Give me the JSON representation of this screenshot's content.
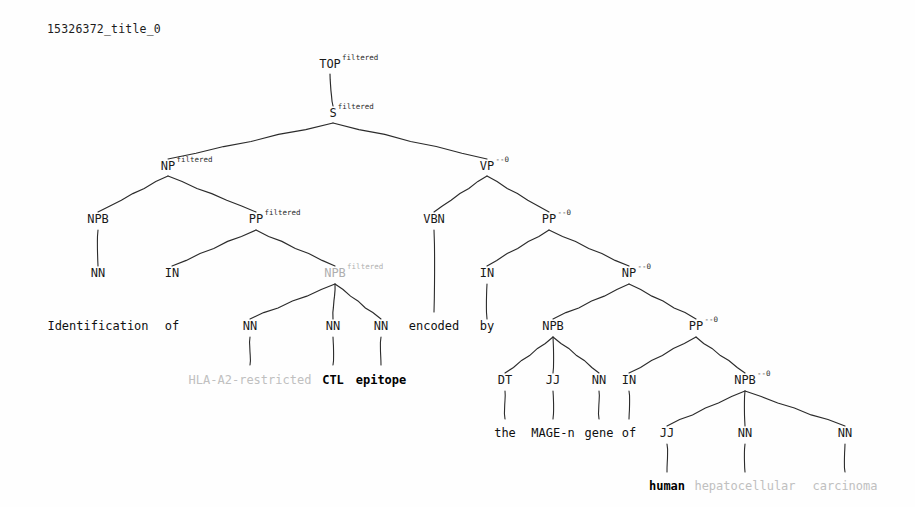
{
  "document": {
    "title": "15326372_title_0",
    "background_color": "#fefefe",
    "ink_color": "#1a1a1a",
    "filtered_color": "#b0b0b0"
  },
  "chart_data": {
    "type": "tree",
    "title": "15326372_title_0",
    "sentence": "Identification of HLA-A2-restricted CTL epitope encoded by the MAGE-n gene of human hepatocellular carcinoma",
    "annotation_legend": {
      "filtered": "filtered",
      "head": "--0"
    },
    "nodes": [
      {
        "id": "top",
        "label": "TOP",
        "sup": "filtered",
        "x": 330,
        "y": 68,
        "gray": false
      },
      {
        "id": "s",
        "label": "S",
        "sup": "filtered",
        "x": 333,
        "y": 117,
        "gray": false
      },
      {
        "id": "np1",
        "label": "NP",
        "sup": "filtered",
        "x": 168,
        "y": 170,
        "gray": false
      },
      {
        "id": "vp",
        "label": "VP",
        "sup": "--0",
        "x": 487,
        "y": 170,
        "gray": false
      },
      {
        "id": "npb1",
        "label": "NPB",
        "sup": "",
        "x": 98,
        "y": 223,
        "gray": false
      },
      {
        "id": "pp1",
        "label": "PP",
        "sup": "filtered",
        "x": 256,
        "y": 223,
        "gray": false
      },
      {
        "id": "vbn",
        "label": "VBN",
        "sup": "",
        "x": 434,
        "y": 223,
        "gray": false
      },
      {
        "id": "pp2",
        "label": "PP",
        "sup": "--0",
        "x": 549,
        "y": 223,
        "gray": false
      },
      {
        "id": "nn1",
        "label": "NN",
        "sup": "",
        "x": 98,
        "y": 277,
        "gray": false
      },
      {
        "id": "in1",
        "label": "IN",
        "sup": "",
        "x": 172,
        "y": 277,
        "gray": false
      },
      {
        "id": "npb2",
        "label": "NPB",
        "sup": "filtered",
        "x": 335,
        "y": 277,
        "gray": true
      },
      {
        "id": "in2",
        "label": "IN",
        "sup": "",
        "x": 487,
        "y": 277,
        "gray": false
      },
      {
        "id": "np2",
        "label": "NP",
        "sup": "--0",
        "x": 629,
        "y": 277,
        "gray": false
      },
      {
        "id": "nn2",
        "label": "NN",
        "sup": "",
        "x": 250,
        "y": 330,
        "gray": false
      },
      {
        "id": "nn3",
        "label": "NN",
        "sup": "",
        "x": 333,
        "y": 330,
        "gray": false
      },
      {
        "id": "nn4",
        "label": "NN",
        "sup": "",
        "x": 381,
        "y": 330,
        "gray": false
      },
      {
        "id": "npb3",
        "label": "NPB",
        "sup": "",
        "x": 553,
        "y": 330,
        "gray": false
      },
      {
        "id": "pp3",
        "label": "PP",
        "sup": "--0",
        "x": 696,
        "y": 330,
        "gray": false
      },
      {
        "id": "dt",
        "label": "DT",
        "sup": "",
        "x": 505,
        "y": 384,
        "gray": false
      },
      {
        "id": "jj1",
        "label": "JJ",
        "sup": "",
        "x": 553,
        "y": 384,
        "gray": false
      },
      {
        "id": "nn5",
        "label": "NN",
        "sup": "",
        "x": 599,
        "y": 384,
        "gray": false
      },
      {
        "id": "in3",
        "label": "IN",
        "sup": "",
        "x": 629,
        "y": 384,
        "gray": false
      },
      {
        "id": "npb4",
        "label": "NPB",
        "sup": "--0",
        "x": 745,
        "y": 384,
        "gray": false
      },
      {
        "id": "jj2",
        "label": "JJ",
        "sup": "",
        "x": 667,
        "y": 437,
        "gray": false
      },
      {
        "id": "nn6",
        "label": "NN",
        "sup": "",
        "x": 745,
        "y": 437,
        "gray": false
      },
      {
        "id": "nn7",
        "label": "NN",
        "sup": "",
        "x": 845,
        "y": 437,
        "gray": false
      }
    ],
    "edges": [
      {
        "from": "top",
        "to": "s",
        "x1": 330,
        "y1": 74,
        "x2": 333,
        "y2": 106
      },
      {
        "from": "s",
        "to": "np1",
        "x1": 333,
        "y1": 123,
        "x2": 168,
        "y2": 159
      },
      {
        "from": "s",
        "to": "vp",
        "x1": 333,
        "y1": 123,
        "x2": 487,
        "y2": 159
      },
      {
        "from": "np1",
        "to": "npb1",
        "x1": 168,
        "y1": 176,
        "x2": 98,
        "y2": 212
      },
      {
        "from": "np1",
        "to": "pp1",
        "x1": 168,
        "y1": 176,
        "x2": 256,
        "y2": 212
      },
      {
        "from": "vp",
        "to": "vbn",
        "x1": 487,
        "y1": 176,
        "x2": 434,
        "y2": 212
      },
      {
        "from": "vp",
        "to": "pp2",
        "x1": 487,
        "y1": 176,
        "x2": 549,
        "y2": 212
      },
      {
        "from": "npb1",
        "to": "nn1",
        "x1": 98,
        "y1": 230,
        "x2": 98,
        "y2": 266
      },
      {
        "from": "pp1",
        "to": "in1",
        "x1": 256,
        "y1": 230,
        "x2": 172,
        "y2": 266
      },
      {
        "from": "pp1",
        "to": "npb2",
        "x1": 256,
        "y1": 230,
        "x2": 335,
        "y2": 266
      },
      {
        "from": "vbn",
        "to": "enc",
        "x1": 434,
        "y1": 230,
        "x2": 434,
        "y2": 312
      },
      {
        "from": "pp2",
        "to": "in2",
        "x1": 549,
        "y1": 230,
        "x2": 487,
        "y2": 266
      },
      {
        "from": "pp2",
        "to": "np2",
        "x1": 549,
        "y1": 230,
        "x2": 629,
        "y2": 266
      },
      {
        "from": "npb2",
        "to": "nn2",
        "x1": 335,
        "y1": 284,
        "x2": 250,
        "y2": 319
      },
      {
        "from": "npb2",
        "to": "nn3",
        "x1": 335,
        "y1": 284,
        "x2": 333,
        "y2": 319
      },
      {
        "from": "npb2",
        "to": "nn4",
        "x1": 335,
        "y1": 284,
        "x2": 381,
        "y2": 319
      },
      {
        "from": "in2",
        "to": "by",
        "x1": 487,
        "y1": 284,
        "x2": 487,
        "y2": 319
      },
      {
        "from": "np2",
        "to": "npb3",
        "x1": 629,
        "y1": 284,
        "x2": 553,
        "y2": 319
      },
      {
        "from": "np2",
        "to": "pp3",
        "x1": 629,
        "y1": 284,
        "x2": 696,
        "y2": 319
      },
      {
        "from": "nn2",
        "to": "hla",
        "x1": 250,
        "y1": 337,
        "x2": 250,
        "y2": 365
      },
      {
        "from": "nn3",
        "to": "ctl",
        "x1": 333,
        "y1": 337,
        "x2": 333,
        "y2": 365
      },
      {
        "from": "nn4",
        "to": "epi",
        "x1": 381,
        "y1": 337,
        "x2": 381,
        "y2": 365
      },
      {
        "from": "npb3",
        "to": "dt",
        "x1": 553,
        "y1": 337,
        "x2": 505,
        "y2": 373
      },
      {
        "from": "npb3",
        "to": "jj1",
        "x1": 553,
        "y1": 337,
        "x2": 553,
        "y2": 373
      },
      {
        "from": "npb3",
        "to": "nn5",
        "x1": 553,
        "y1": 337,
        "x2": 599,
        "y2": 373
      },
      {
        "from": "pp3",
        "to": "in3",
        "x1": 696,
        "y1": 337,
        "x2": 629,
        "y2": 373
      },
      {
        "from": "pp3",
        "to": "npb4",
        "x1": 696,
        "y1": 337,
        "x2": 745,
        "y2": 373
      },
      {
        "from": "dt",
        "to": "the",
        "x1": 505,
        "y1": 391,
        "x2": 505,
        "y2": 419
      },
      {
        "from": "jj1",
        "to": "mage",
        "x1": 553,
        "y1": 391,
        "x2": 553,
        "y2": 419
      },
      {
        "from": "nn5",
        "to": "gene",
        "x1": 599,
        "y1": 391,
        "x2": 599,
        "y2": 419
      },
      {
        "from": "in3",
        "to": "of2",
        "x1": 629,
        "y1": 391,
        "x2": 629,
        "y2": 419
      },
      {
        "from": "npb4",
        "to": "jj2",
        "x1": 745,
        "y1": 391,
        "x2": 667,
        "y2": 426
      },
      {
        "from": "npb4",
        "to": "nn6",
        "x1": 745,
        "y1": 391,
        "x2": 745,
        "y2": 426
      },
      {
        "from": "npb4",
        "to": "nn7",
        "x1": 745,
        "y1": 391,
        "x2": 845,
        "y2": 426
      },
      {
        "from": "jj2",
        "to": "human",
        "x1": 667,
        "y1": 444,
        "x2": 667,
        "y2": 472
      },
      {
        "from": "nn6",
        "to": "hepa",
        "x1": 745,
        "y1": 444,
        "x2": 745,
        "y2": 472
      },
      {
        "from": "nn7",
        "to": "carc",
        "x1": 845,
        "y1": 444,
        "x2": 845,
        "y2": 472
      }
    ],
    "leaves": [
      {
        "id": "ident",
        "text": "Identification",
        "x": 98,
        "y": 330,
        "style": "plain"
      },
      {
        "id": "of1",
        "text": "of",
        "x": 172,
        "y": 330,
        "style": "plain"
      },
      {
        "id": "enc",
        "text": "encoded",
        "x": 434,
        "y": 330,
        "style": "plain"
      },
      {
        "id": "by",
        "text": "by",
        "x": 487,
        "y": 330,
        "style": "plain"
      },
      {
        "id": "hla",
        "text": "HLA-A2-restricted",
        "x": 250,
        "y": 384,
        "style": "gray"
      },
      {
        "id": "ctl",
        "text": "CTL",
        "x": 333,
        "y": 384,
        "style": "bold"
      },
      {
        "id": "epi",
        "text": "epitope",
        "x": 381,
        "y": 384,
        "style": "bold"
      },
      {
        "id": "the",
        "text": "the",
        "x": 505,
        "y": 437,
        "style": "plain"
      },
      {
        "id": "mage",
        "text": "MAGE-n",
        "x": 553,
        "y": 437,
        "style": "plain"
      },
      {
        "id": "gene",
        "text": "gene",
        "x": 599,
        "y": 437,
        "style": "plain"
      },
      {
        "id": "of2",
        "text": "of",
        "x": 629,
        "y": 437,
        "style": "plain"
      },
      {
        "id": "human",
        "text": "human",
        "x": 667,
        "y": 490,
        "style": "bold"
      },
      {
        "id": "hepa",
        "text": "hepatocellular",
        "x": 745,
        "y": 490,
        "style": "gray"
      },
      {
        "id": "carc",
        "text": "carcinoma",
        "x": 845,
        "y": 490,
        "style": "gray"
      }
    ]
  }
}
